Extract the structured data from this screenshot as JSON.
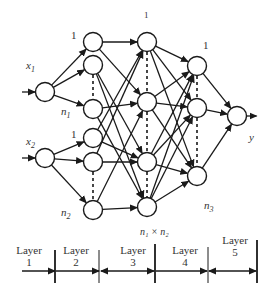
{
  "diagram": {
    "colors": {
      "stroke": "#1a1a1a",
      "text": "#333333",
      "background": "#ffffff"
    },
    "inputs": [
      {
        "label": "x",
        "sub": "1"
      },
      {
        "label": "x",
        "sub": "2"
      }
    ],
    "node_labels": {
      "l2_top1": "1",
      "l2_n1": "n",
      "l2_n1_sub": "1",
      "l2_top2": "1",
      "l2_n2": "n",
      "l2_n2_sub": "2",
      "l3_top": "1",
      "l3_bottom": "n₁ × n₂",
      "l4_top": "1",
      "l4_bottom": "n",
      "l4_bottom_sub": "3",
      "output": "y"
    },
    "layers": [
      {
        "name": "Layer",
        "num": "1"
      },
      {
        "name": "Layer",
        "num": "2"
      },
      {
        "name": "Layer",
        "num": "3"
      },
      {
        "name": "Layer",
        "num": "4"
      },
      {
        "name": "Layer",
        "num": "5"
      }
    ]
  }
}
